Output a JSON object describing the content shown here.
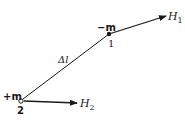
{
  "diagram": {
    "point1": {
      "label": "1",
      "charge": "−m",
      "x": 109,
      "y": 34,
      "style": "filled"
    },
    "point2": {
      "label": "2",
      "charge": "+m",
      "x": 21,
      "y": 101,
      "style": "open"
    },
    "segment": {
      "label": "Δl"
    },
    "vector1": {
      "label_main": "H",
      "label_sub": "1"
    },
    "vector2": {
      "label_main": "H",
      "label_sub": "2"
    },
    "colors": {
      "ink": "#1a1a1a",
      "background": "#ffffff"
    }
  }
}
